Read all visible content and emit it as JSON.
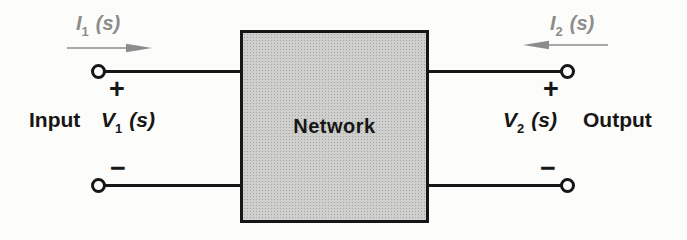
{
  "diagram": {
    "type": "two-port-network-block-diagram",
    "network_label": "Network",
    "input_word": "Input",
    "output_word": "Output",
    "i1": {
      "symbol": "I",
      "sub": "1",
      "arg": "(s)"
    },
    "i2": {
      "symbol": "I",
      "sub": "2",
      "arg": "(s)"
    },
    "v1": {
      "symbol": "V",
      "sub": "1",
      "arg": "(s)"
    },
    "v2": {
      "symbol": "V",
      "sub": "2",
      "arg": "(s)"
    },
    "plus_sign": "+",
    "minus_sign": "−",
    "arrow_directions": {
      "i1": "right",
      "i2": "left"
    },
    "colors": {
      "background": "#fcfcfa",
      "wire": "#161616",
      "text": "#161616",
      "box_fill": "#cfcfcd",
      "box_dot": "#a3a3a0",
      "box_border": "#161616",
      "current_label": "#8c8c8c",
      "arrow": "#8c8c8c"
    }
  }
}
